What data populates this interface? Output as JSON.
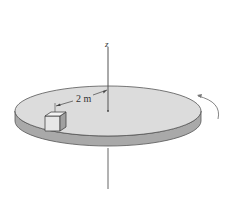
{
  "diagram": {
    "type": "rotating-disk-with-block",
    "axis": {
      "label": "z"
    },
    "dimension": {
      "label": "2 m"
    },
    "colors": {
      "background": "#ffffff",
      "disk_top": "#dcdcdc",
      "disk_side": "#a9a9a9",
      "outline": "#555555",
      "block_front": "#e6e6e6",
      "block_side": "#a0a0a0",
      "block_top": "#f2f2f2"
    },
    "rotation_arrow": {
      "direction": "counter-clockwise (viewed from above)"
    }
  }
}
